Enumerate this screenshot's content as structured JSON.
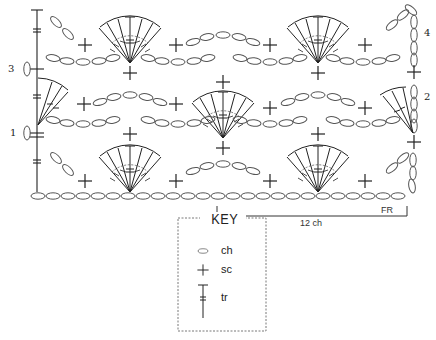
{
  "diagram": {
    "type": "crochet-stitch-chart",
    "row_labels": [
      {
        "label": "1",
        "side": "left"
      },
      {
        "label": "2",
        "side": "right"
      },
      {
        "label": "3",
        "side": "left"
      },
      {
        "label": "4",
        "side": "right"
      }
    ],
    "repeat": {
      "label": "12 ch",
      "end_label": "FR"
    },
    "foundation_chain_links": 25,
    "fan_stitches": 7,
    "colors": {
      "ink": "#222222",
      "chain_ink": "#555555",
      "dashed_border": "#555555"
    }
  },
  "key": {
    "title": "KEY",
    "items": [
      {
        "symbol": "chain-oval",
        "label": "ch"
      },
      {
        "symbol": "plus",
        "label": "sc"
      },
      {
        "symbol": "treble-post",
        "label": "tr"
      }
    ]
  }
}
